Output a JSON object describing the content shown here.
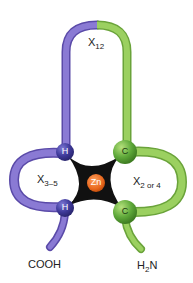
{
  "diagram": {
    "colors": {
      "purple_chain": "#7e6cc9",
      "purple_chain_dark": "#5a4aa8",
      "purple_residue": "#3f3a9a",
      "green_chain": "#8cc453",
      "green_chain_dark": "#6aa33a",
      "green_residue": "#5fa93a",
      "zinc": "#e8661c",
      "coordination_bonds": "#111111"
    },
    "labels": {
      "top_loop": {
        "main": "X",
        "sub": "12"
      },
      "left_loop": {
        "main": "X",
        "sub": "3–5"
      },
      "right_loop": {
        "main": "X",
        "sub": "2 or 4"
      },
      "c_terminus": "COOH",
      "n_terminus": {
        "main": "H",
        "sub": "2",
        "tail": "N"
      }
    },
    "residues": [
      {
        "id": "his-upper",
        "label": "H",
        "chain": "purple"
      },
      {
        "id": "his-lower",
        "label": "H",
        "chain": "purple"
      },
      {
        "id": "cys-upper",
        "label": "C",
        "chain": "green"
      },
      {
        "id": "cys-lower",
        "label": "C",
        "chain": "green"
      }
    ],
    "metal": {
      "label": "Zn"
    }
  }
}
